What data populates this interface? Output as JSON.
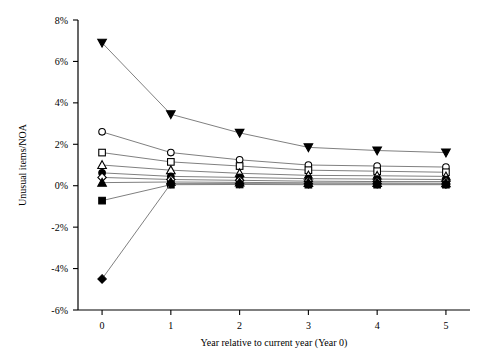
{
  "chart_data": {
    "type": "line",
    "title": "",
    "xlabel": "Year relative to current year (Year 0)",
    "ylabel": "Unusual items/NOA",
    "x": [
      0,
      1,
      2,
      3,
      4,
      5
    ],
    "xlim": [
      -0.35,
      5.35
    ],
    "ylim": [
      -6,
      8
    ],
    "xticks": [
      0,
      1,
      2,
      3,
      4,
      5
    ],
    "xticklabels": [
      "0",
      "1",
      "2",
      "3",
      "4",
      "5"
    ],
    "yticks": [
      -6,
      -4,
      -2,
      0,
      2,
      4,
      6,
      8
    ],
    "yticklabels": [
      "-6%",
      "-4%",
      "-2%",
      "0%",
      "2%",
      "4%",
      "6%",
      "8%"
    ],
    "grid": false,
    "legend": "none",
    "series": [
      {
        "name": "portfolio-1",
        "marker": "filled-triangle-down",
        "values": [
          6.9,
          3.45,
          2.55,
          1.85,
          1.7,
          1.6
        ]
      },
      {
        "name": "portfolio-2",
        "marker": "open-circle",
        "values": [
          2.6,
          1.6,
          1.25,
          1.0,
          0.95,
          0.9
        ]
      },
      {
        "name": "portfolio-3",
        "marker": "open-square",
        "values": [
          1.6,
          1.15,
          0.95,
          0.75,
          0.7,
          0.65
        ]
      },
      {
        "name": "portfolio-4",
        "marker": "open-triangle-up",
        "values": [
          1.0,
          0.75,
          0.6,
          0.5,
          0.48,
          0.45
        ]
      },
      {
        "name": "portfolio-5",
        "marker": "filled-circle",
        "values": [
          0.62,
          0.45,
          0.4,
          0.34,
          0.32,
          0.3
        ]
      },
      {
        "name": "portfolio-6",
        "marker": "open-diamond",
        "values": [
          0.4,
          0.3,
          0.26,
          0.22,
          0.2,
          0.2
        ]
      },
      {
        "name": "portfolio-7",
        "marker": "filled-triangle-up",
        "values": [
          0.15,
          0.18,
          0.16,
          0.14,
          0.13,
          0.12
        ]
      },
      {
        "name": "portfolio-8",
        "marker": "filled-square",
        "values": [
          -0.72,
          0.05,
          0.06,
          0.05,
          0.05,
          0.05
        ]
      },
      {
        "name": "portfolio-9",
        "marker": "filled-diamond",
        "values": [
          -4.5,
          0.1,
          0.1,
          0.09,
          0.09,
          0.08
        ]
      }
    ],
    "colors": {
      "line": "#808080",
      "marker_fill": "#000000",
      "marker_stroke": "#000000",
      "axis": "#000000",
      "background": "#ffffff"
    }
  }
}
